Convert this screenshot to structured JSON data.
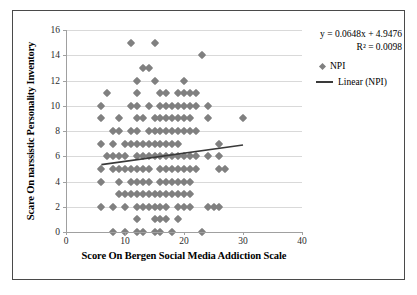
{
  "figure": {
    "caption": ""
  },
  "chart_data": {
    "type": "scatter",
    "title": "",
    "xlabel": "Score On Bergen Social Media Addiction Scale",
    "ylabel": "Scare On narssistic Personality Inventory",
    "xlim": [
      0,
      40
    ],
    "ylim": [
      0,
      16
    ],
    "xticks": [
      0,
      10,
      20,
      30,
      40
    ],
    "yticks": [
      0,
      2,
      4,
      6,
      8,
      10,
      12,
      14,
      16
    ],
    "grid": "horizontal",
    "legend_position": "right",
    "series": [
      {
        "name": "NPI",
        "marker": "diamond",
        "color": "#808080",
        "points": [
          [
            11,
            15
          ],
          [
            15,
            15
          ],
          [
            23,
            14
          ],
          [
            13,
            13
          ],
          [
            14,
            13
          ],
          [
            12,
            12
          ],
          [
            15,
            12
          ],
          [
            20,
            12
          ],
          [
            7,
            11
          ],
          [
            12,
            11
          ],
          [
            16,
            11
          ],
          [
            17,
            11
          ],
          [
            19,
            11
          ],
          [
            20,
            11
          ],
          [
            21,
            11
          ],
          [
            22,
            11
          ],
          [
            6,
            10
          ],
          [
            11,
            10
          ],
          [
            12,
            10
          ],
          [
            14,
            10
          ],
          [
            16,
            10
          ],
          [
            17,
            10
          ],
          [
            18,
            10
          ],
          [
            19,
            10
          ],
          [
            20,
            10
          ],
          [
            21,
            10
          ],
          [
            22,
            10
          ],
          [
            24,
            10
          ],
          [
            6,
            9
          ],
          [
            9,
            9
          ],
          [
            12,
            9
          ],
          [
            13,
            9
          ],
          [
            15,
            9
          ],
          [
            16,
            9
          ],
          [
            17,
            9
          ],
          [
            18,
            9
          ],
          [
            19,
            9
          ],
          [
            20,
            9
          ],
          [
            21,
            9
          ],
          [
            24,
            9
          ],
          [
            30,
            9
          ],
          [
            8,
            8
          ],
          [
            9,
            8
          ],
          [
            11,
            8
          ],
          [
            12,
            8
          ],
          [
            14,
            8
          ],
          [
            15,
            8
          ],
          [
            16,
            8
          ],
          [
            17,
            8
          ],
          [
            18,
            8
          ],
          [
            19,
            8
          ],
          [
            20,
            8
          ],
          [
            21,
            8
          ],
          [
            22,
            8
          ],
          [
            6,
            7
          ],
          [
            8,
            7
          ],
          [
            10,
            7
          ],
          [
            11,
            7
          ],
          [
            12,
            7
          ],
          [
            13,
            7
          ],
          [
            14,
            7
          ],
          [
            15,
            7
          ],
          [
            16,
            7
          ],
          [
            17,
            7
          ],
          [
            18,
            7
          ],
          [
            19,
            7
          ],
          [
            26,
            7
          ],
          [
            7,
            6
          ],
          [
            8,
            6
          ],
          [
            9,
            6
          ],
          [
            10,
            6
          ],
          [
            12,
            6
          ],
          [
            13,
            6
          ],
          [
            14,
            6
          ],
          [
            15,
            6
          ],
          [
            16,
            6
          ],
          [
            17,
            6
          ],
          [
            18,
            6
          ],
          [
            19,
            6
          ],
          [
            20,
            6
          ],
          [
            21,
            6
          ],
          [
            22,
            6
          ],
          [
            24,
            6
          ],
          [
            26,
            6
          ],
          [
            6,
            5
          ],
          [
            8,
            5
          ],
          [
            9,
            5
          ],
          [
            10,
            5
          ],
          [
            11,
            5
          ],
          [
            12,
            5
          ],
          [
            13,
            5
          ],
          [
            14,
            5
          ],
          [
            16,
            5
          ],
          [
            17,
            5
          ],
          [
            18,
            5
          ],
          [
            19,
            5
          ],
          [
            20,
            5
          ],
          [
            21,
            5
          ],
          [
            22,
            5
          ],
          [
            26,
            5
          ],
          [
            27,
            5
          ],
          [
            6,
            4
          ],
          [
            9,
            4
          ],
          [
            11,
            4
          ],
          [
            12,
            4
          ],
          [
            13,
            4
          ],
          [
            14,
            4
          ],
          [
            16,
            4
          ],
          [
            17,
            4
          ],
          [
            18,
            4
          ],
          [
            19,
            4
          ],
          [
            20,
            4
          ],
          [
            21,
            4
          ],
          [
            9,
            3
          ],
          [
            10,
            3
          ],
          [
            11,
            3
          ],
          [
            12,
            3
          ],
          [
            13,
            3
          ],
          [
            14,
            3
          ],
          [
            15,
            3
          ],
          [
            16,
            3
          ],
          [
            17,
            3
          ],
          [
            18,
            3
          ],
          [
            19,
            3
          ],
          [
            20,
            3
          ],
          [
            21,
            3
          ],
          [
            6,
            2
          ],
          [
            8,
            2
          ],
          [
            10,
            2
          ],
          [
            12,
            2
          ],
          [
            13,
            2
          ],
          [
            14,
            2
          ],
          [
            15,
            2
          ],
          [
            16,
            2
          ],
          [
            17,
            2
          ],
          [
            19,
            2
          ],
          [
            20,
            2
          ],
          [
            21,
            2
          ],
          [
            24,
            2
          ],
          [
            25,
            2
          ],
          [
            26,
            2
          ],
          [
            12,
            1
          ],
          [
            15,
            1
          ],
          [
            16,
            1
          ],
          [
            17,
            1
          ],
          [
            19,
            1
          ],
          [
            8,
            0
          ],
          [
            10,
            0
          ],
          [
            12,
            0
          ],
          [
            13,
            0
          ],
          [
            15,
            0
          ],
          [
            16,
            0
          ],
          [
            18,
            0
          ],
          [
            23,
            0
          ]
        ]
      }
    ],
    "trendline": {
      "name": "Linear (NPI)",
      "color": "#3a3a3a",
      "equation": "y = 0.0648x + 4.9476",
      "r2_label": "R² = 0.0098",
      "slope": 0.0648,
      "intercept": 4.9476,
      "r_squared": 0.0098,
      "x_start": 6,
      "x_end": 30
    },
    "legend": [
      {
        "label": "NPI",
        "kind": "marker"
      },
      {
        "label": "Linear (NPI)",
        "kind": "line"
      }
    ]
  }
}
